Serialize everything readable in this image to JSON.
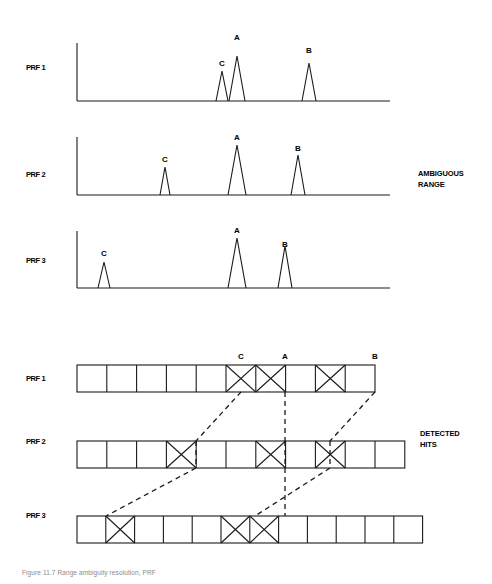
{
  "figure": {
    "caption": "Figure 11.7  Range ambiguity resolution, PRF"
  },
  "side_labels": {
    "ambiguous_range": {
      "line1": "AMBIGUOUS",
      "line2": "RANGE",
      "x": 418,
      "y": 168
    },
    "detected_hits": {
      "line1": "DETECTED",
      "line2": "HITS",
      "x": 420,
      "y": 428
    }
  },
  "waveforms": {
    "row_label_x": 26,
    "axis_left": 77,
    "axis_right": 390,
    "rows": [
      {
        "label": "PRF 1",
        "label_y": 63,
        "baseline_y": 101,
        "top_y": 43,
        "tx_pulse_height": 58,
        "peaks": [
          {
            "name": "C",
            "x": 222,
            "height": 30,
            "half_width": 6,
            "label_y": 59
          },
          {
            "name": "A",
            "x": 237,
            "height": 45,
            "half_width": 8,
            "label_y": 33
          },
          {
            "name": "B",
            "x": 309,
            "height": 38,
            "half_width": 7,
            "label_y": 46
          }
        ]
      },
      {
        "label": "PRF 2",
        "label_y": 170,
        "baseline_y": 195,
        "top_y": 137,
        "tx_pulse_height": 58,
        "peaks": [
          {
            "name": "C",
            "x": 165,
            "height": 28,
            "half_width": 5,
            "label_y": 155
          },
          {
            "name": "A",
            "x": 237,
            "height": 50,
            "half_width": 9,
            "label_y": 133
          },
          {
            "name": "B",
            "x": 298,
            "height": 40,
            "half_width": 7,
            "label_y": 144
          }
        ]
      },
      {
        "label": "PRF 3",
        "label_y": 256,
        "baseline_y": 288,
        "top_y": 231,
        "tx_pulse_height": 57,
        "peaks": [
          {
            "name": "C",
            "x": 104,
            "height": 26,
            "half_width": 6,
            "label_y": 249
          },
          {
            "name": "A",
            "x": 237,
            "height": 50,
            "half_width": 9,
            "label_y": 226
          },
          {
            "name": "B",
            "x": 285,
            "height": 42,
            "half_width": 7,
            "label_y": 240
          }
        ]
      }
    ]
  },
  "bin_rows": {
    "row_label_x": 26,
    "cell_height": 27,
    "rows": [
      {
        "label": "PRF 1",
        "label_y": 374,
        "top_y": 365,
        "left_x": 77,
        "cell_width": 29.8,
        "cell_count": 10,
        "hits": [
          5,
          6,
          8
        ]
      },
      {
        "label": "PRF 2",
        "label_y": 437,
        "top_y": 441,
        "left_x": 77,
        "cell_width": 29.8,
        "cell_count": 11,
        "hits": [
          3,
          6,
          8
        ]
      },
      {
        "label": "PRF 3",
        "label_y": 511,
        "top_y": 516,
        "left_x": 77,
        "cell_width": 28.8,
        "cell_count": 12,
        "hits": [
          1,
          5,
          6
        ]
      }
    ],
    "column_labels": [
      {
        "name": "C",
        "x": 241,
        "y": 352
      },
      {
        "name": "A",
        "x": 285,
        "y": 352
      },
      {
        "name": "B",
        "x": 375,
        "y": 352
      }
    ],
    "correlation_lines": [
      {
        "target": "C",
        "points": [
          [
            241,
            392
          ],
          [
            196,
            441
          ],
          [
            196,
            468
          ],
          [
            106,
            516
          ]
        ]
      },
      {
        "target": "A",
        "points": [
          [
            285,
            392
          ],
          [
            285,
            441
          ],
          [
            285,
            468
          ],
          [
            285,
            516
          ]
        ]
      },
      {
        "target": "B",
        "points": [
          [
            375,
            392
          ],
          [
            330,
            441
          ],
          [
            330,
            468
          ],
          [
            255,
            516
          ]
        ]
      }
    ]
  },
  "style": {
    "stroke": "#1a1a1a",
    "stroke_width": 1.1,
    "dash_pattern": "5,4"
  }
}
